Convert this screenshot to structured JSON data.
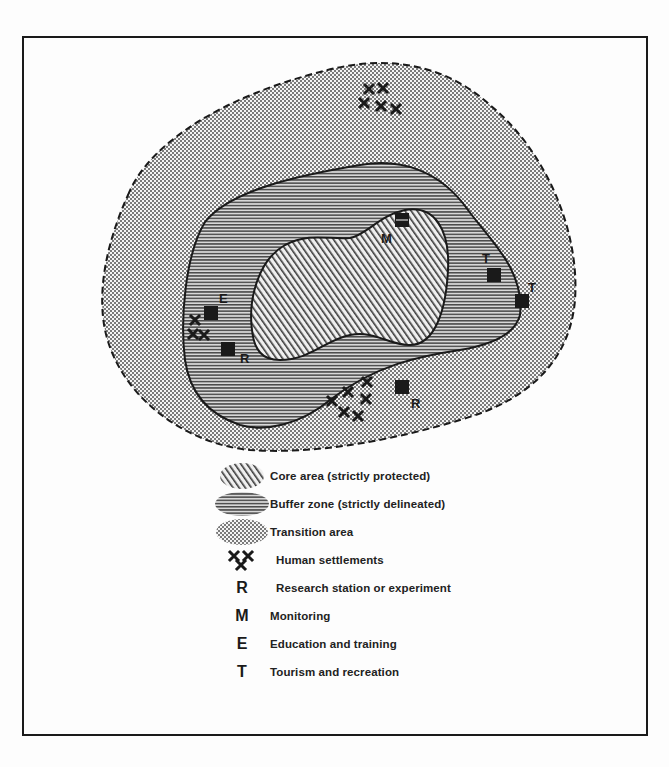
{
  "diagram": {
    "zones": [
      {
        "id": "core",
        "pattern": "diagonal-hatch"
      },
      {
        "id": "buffer",
        "pattern": "horizontal-lines"
      },
      {
        "id": "transition",
        "pattern": "dots"
      }
    ],
    "map_labels": {
      "monitoring": "M",
      "education": "E",
      "research_1": "R",
      "research_2": "R",
      "tourism_1": "T",
      "tourism_2": "T"
    },
    "colors": {
      "ink": "#1a1a1a",
      "paper": "#fdfdfd"
    }
  },
  "legend": {
    "items": [
      {
        "symbol": "core-swatch",
        "label": "Core area (strictly protected)"
      },
      {
        "symbol": "buffer-swatch",
        "label": "Buffer zone (strictly delineated)"
      },
      {
        "symbol": "transition-swatch",
        "label": "Transition area"
      },
      {
        "symbol": "settlement-icon",
        "label": "Human settlements"
      },
      {
        "symbol": "R",
        "label": "Research station or experiment"
      },
      {
        "symbol": "M",
        "label": "Monitoring"
      },
      {
        "symbol": "E",
        "label": "Education and training"
      },
      {
        "symbol": "T",
        "label": "Tourism and recreation"
      }
    ]
  }
}
